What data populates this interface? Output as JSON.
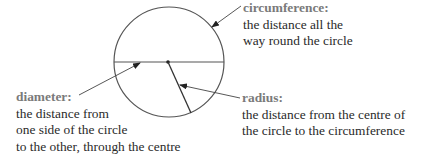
{
  "diagram": {
    "colors": {
      "stroke": "#555555",
      "term": "#7a7a7a",
      "text": "#2a2a2a",
      "background": "#ffffff"
    },
    "circle": {
      "cx": 169,
      "cy": 62,
      "r": 55
    },
    "labels": {
      "circumference": {
        "term": "circumference:",
        "lines": [
          "the distance all the",
          "way round the circle"
        ]
      },
      "diameter": {
        "term": "diameter:",
        "lines": [
          "the distance from",
          "one side of the circle",
          "to the other, through the centre"
        ]
      },
      "radius": {
        "term": "radius:",
        "lines": [
          "the distance from the centre of",
          "the circle to the circumference"
        ]
      }
    }
  }
}
